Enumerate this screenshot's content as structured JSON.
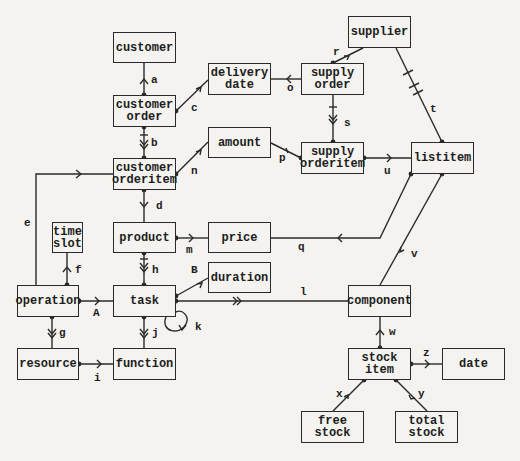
{
  "diagram": {
    "type": "entity-relationship / data model diagram",
    "entities": {
      "customer": "customer",
      "delivery_date": "delivery\ndate",
      "supplier": "supplier",
      "customer_order": "customer\norder",
      "supply_order": "supply\norder",
      "amount": "amount",
      "customer_orderitem": "customer\norderitem",
      "supply_orderitem": "supply\norderitem",
      "listitem": "listitem",
      "time_slot": "time\nslot",
      "product": "product",
      "price": "price",
      "duration": "duration",
      "operation": "operation",
      "task": "task",
      "component": "component",
      "resource": "resource",
      "function": "function",
      "stock_item": "stock\nitem",
      "date": "date",
      "free_stock": "free\nstock",
      "total_stock": "total\nstock"
    },
    "relationships": {
      "a": "a",
      "b": "b",
      "c": "c",
      "d": "d",
      "e": "e",
      "f": "f",
      "g": "g",
      "h": "h",
      "i": "i",
      "j": "j",
      "k": "k",
      "l": "l",
      "m": "m",
      "n": "n",
      "o": "o",
      "p": "p",
      "q": "q",
      "r": "r",
      "s": "s",
      "t": "t",
      "u": "u",
      "v": "v",
      "w": "w",
      "x": "x",
      "y": "y",
      "z": "z",
      "A": "A",
      "B": "B"
    },
    "edges": [
      {
        "label": "a",
        "from": "customer order",
        "to": "customer",
        "style": "single-arrow"
      },
      {
        "label": "b",
        "from": "customer order",
        "to": "customer orderitem",
        "style": "double-arrow-with-bar"
      },
      {
        "label": "c",
        "from": "customer order",
        "to": "delivery date",
        "style": "single-arrow"
      },
      {
        "label": "d",
        "from": "customer orderitem",
        "to": "product",
        "style": "single-arrow"
      },
      {
        "label": "e",
        "from": "operation",
        "to": "customer orderitem",
        "style": "single-arrow"
      },
      {
        "label": "f",
        "from": "operation",
        "to": "time slot",
        "style": "single-arrow"
      },
      {
        "label": "g",
        "from": "operation",
        "to": "resource",
        "style": "double-arrow"
      },
      {
        "label": "h",
        "from": "product",
        "to": "task",
        "style": "double-arrow-with-bar"
      },
      {
        "label": "i",
        "from": "resource",
        "to": "function",
        "style": "single-arrow"
      },
      {
        "label": "j",
        "from": "task",
        "to": "function",
        "style": "double-arrow"
      },
      {
        "label": "k",
        "from": "task",
        "to": "task",
        "style": "self-loop"
      },
      {
        "label": "l",
        "from": "task",
        "to": "component",
        "style": "double-arrow"
      },
      {
        "label": "m",
        "from": "product",
        "to": "price",
        "style": "single-arrow"
      },
      {
        "label": "n",
        "from": "customer orderitem",
        "to": "amount",
        "style": "single-arrow"
      },
      {
        "label": "o",
        "from": "supply order",
        "to": "delivery date",
        "style": "single-arrow"
      },
      {
        "label": "p",
        "from": "supply orderitem",
        "to": "amount",
        "style": "single-arrow"
      },
      {
        "label": "q",
        "from": "listitem",
        "to": "price",
        "style": "single-arrow"
      },
      {
        "label": "r",
        "from": "supply order",
        "to": "supplier",
        "style": "single-arrow"
      },
      {
        "label": "s",
        "from": "supply order",
        "to": "supply orderitem",
        "style": "double-arrow-with-bar"
      },
      {
        "label": "t",
        "from": "listitem",
        "to": "supplier",
        "style": "double-bar"
      },
      {
        "label": "u",
        "from": "supply orderitem",
        "to": "listitem",
        "style": "single-arrow"
      },
      {
        "label": "v",
        "from": "listitem",
        "to": "component",
        "style": "single-arrow"
      },
      {
        "label": "w",
        "from": "stock item",
        "to": "component",
        "style": "single-arrow"
      },
      {
        "label": "x",
        "from": "stock item",
        "to": "free stock",
        "style": "single-arrow"
      },
      {
        "label": "y",
        "from": "stock item",
        "to": "total stock",
        "style": "single-arrow"
      },
      {
        "label": "z",
        "from": "stock item",
        "to": "date",
        "style": "single-arrow"
      },
      {
        "label": "A",
        "from": "operation",
        "to": "task",
        "style": "single-arrow"
      },
      {
        "label": "B",
        "from": "task",
        "to": "duration",
        "style": "single-arrow"
      }
    ],
    "colors": {
      "line": "#2a2a2a",
      "background": "#f4f3ef"
    }
  }
}
